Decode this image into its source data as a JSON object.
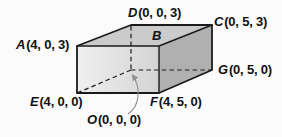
{
  "figure": {
    "type": "3d-coordinate-box-diagram",
    "colors": {
      "background": "#fbfbfb",
      "top_face": "#cbcbcb",
      "front_face_left": "#efefef",
      "front_face_right": "#d4d4d4",
      "right_face": "#b0b0b0",
      "edge": "#1b1b1b",
      "text": "#111111",
      "arrow": "#8f8f8f"
    },
    "vertices": [
      {
        "letter": "A",
        "coords": "(4, 0, 3)"
      },
      {
        "letter": "B",
        "coords": ""
      },
      {
        "letter": "C",
        "coords": "(0, 5, 3)"
      },
      {
        "letter": "D",
        "coords": "(0, 0, 3)"
      },
      {
        "letter": "E",
        "coords": "(4, 0, 0)"
      },
      {
        "letter": "F",
        "coords": "(4, 5, 0)"
      },
      {
        "letter": "G",
        "coords": "(0, 5, 0)"
      },
      {
        "letter": "O",
        "coords": "(0, 0, 0)"
      }
    ]
  }
}
